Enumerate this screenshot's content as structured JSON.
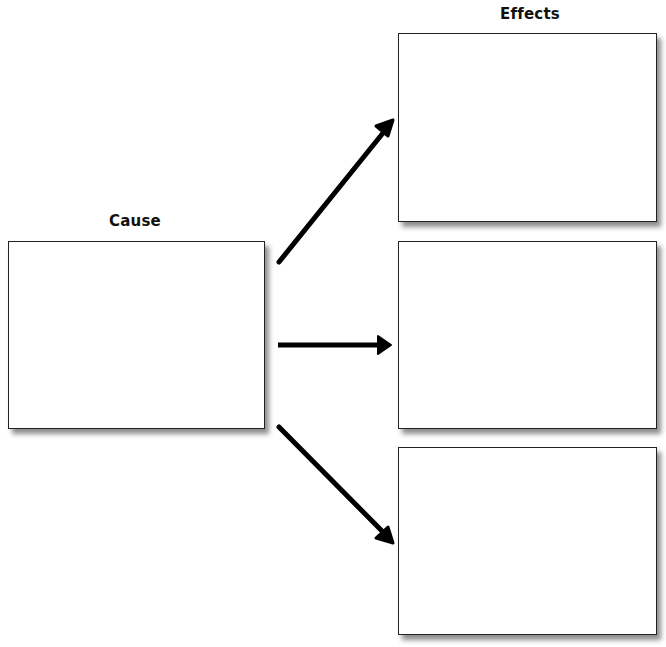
{
  "diagram": {
    "type": "cause-and-effect organizer",
    "cause": {
      "heading": "Cause",
      "boxes": 1
    },
    "effects": {
      "heading": "Effects",
      "boxes": 3
    },
    "arrows": [
      {
        "from": "cause",
        "to": "effect-1",
        "direction": "up-right"
      },
      {
        "from": "cause",
        "to": "effect-2",
        "direction": "right"
      },
      {
        "from": "cause",
        "to": "effect-3",
        "direction": "down-right"
      }
    ],
    "colors": {
      "line": "#000000",
      "box_border": "#222222",
      "background": "#ffffff"
    }
  }
}
